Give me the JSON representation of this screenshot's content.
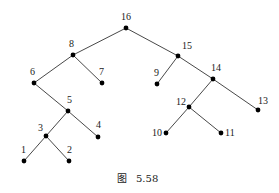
{
  "figure": {
    "caption": "图  5.58",
    "caption_parts": {
      "prefix": "图",
      "number": "5.58"
    }
  },
  "tree": {
    "root": "16",
    "nodes": [
      {
        "id": "16",
        "label": "16",
        "x": 126,
        "y": 28,
        "lx": 121,
        "ly": 20
      },
      {
        "id": "8",
        "label": "8",
        "x": 73,
        "y": 55,
        "lx": 69,
        "ly": 47
      },
      {
        "id": "15",
        "label": "15",
        "x": 178,
        "y": 56,
        "lx": 182,
        "ly": 49
      },
      {
        "id": "6",
        "label": "6",
        "x": 34,
        "y": 83,
        "lx": 30,
        "ly": 75
      },
      {
        "id": "7",
        "label": "7",
        "x": 102,
        "y": 83,
        "lx": 99,
        "ly": 75
      },
      {
        "id": "9",
        "label": "9",
        "x": 157,
        "y": 84,
        "lx": 154,
        "ly": 76
      },
      {
        "id": "14",
        "label": "14",
        "x": 213,
        "y": 79,
        "lx": 211,
        "ly": 71
      },
      {
        "id": "5",
        "label": "5",
        "x": 68,
        "y": 111,
        "lx": 67,
        "ly": 103
      },
      {
        "id": "12",
        "label": "12",
        "x": 189,
        "y": 107,
        "lx": 176,
        "ly": 105
      },
      {
        "id": "13",
        "label": "13",
        "x": 258,
        "y": 110,
        "lx": 258,
        "ly": 104
      },
      {
        "id": "3",
        "label": "3",
        "x": 46,
        "y": 136,
        "lx": 38,
        "ly": 131
      },
      {
        "id": "4",
        "label": "4",
        "x": 98,
        "y": 137,
        "lx": 96,
        "ly": 128
      },
      {
        "id": "10",
        "label": "10",
        "x": 166,
        "y": 133,
        "lx": 152,
        "ly": 136
      },
      {
        "id": "11",
        "label": "11",
        "x": 221,
        "y": 133,
        "lx": 225,
        "ly": 136
      },
      {
        "id": "1",
        "label": "1",
        "x": 24,
        "y": 161,
        "lx": 21,
        "ly": 153
      },
      {
        "id": "2",
        "label": "2",
        "x": 69,
        "y": 161,
        "lx": 67,
        "ly": 153
      }
    ],
    "edges": [
      [
        "16",
        "8"
      ],
      [
        "16",
        "15"
      ],
      [
        "8",
        "6"
      ],
      [
        "8",
        "7"
      ],
      [
        "15",
        "9"
      ],
      [
        "15",
        "14"
      ],
      [
        "6",
        "5"
      ],
      [
        "5",
        "3"
      ],
      [
        "5",
        "4"
      ],
      [
        "3",
        "1"
      ],
      [
        "3",
        "2"
      ],
      [
        "14",
        "12"
      ],
      [
        "14",
        "13"
      ],
      [
        "12",
        "10"
      ],
      [
        "12",
        "11"
      ]
    ]
  }
}
